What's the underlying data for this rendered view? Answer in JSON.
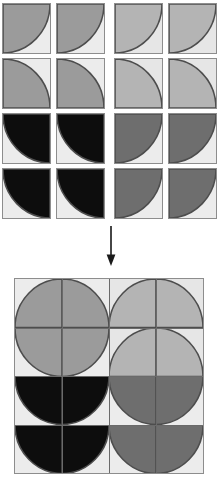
{
  "figure": {
    "arrow": {
      "name": "down-arrow",
      "direction": "down",
      "glyph": "↓"
    }
  },
  "palette": {
    "background": "#ffffff",
    "tile_background": "#ececec",
    "tile_background_light": "#e6e6e6",
    "outline": "#8d8d8d",
    "arc_outline": "#4d4d4d",
    "gridline": "#6a6a6a",
    "fill_mid_gray": "#9b9b9b",
    "fill_light_gray": "#b4b4b4",
    "fill_black": "#0d0d0d",
    "fill_dark_gray": "#6e6e6e",
    "arrow": "#1a1a1a"
  },
  "tileset": {
    "name": "separated-tiles",
    "rows": 4,
    "cols": 4,
    "tile_w": 49,
    "tile_h": 51,
    "gap_x": 5,
    "gap_y": 4,
    "col_extra_gap": [
      0,
      0,
      4,
      0
    ],
    "tiles": [
      {
        "id": "t-r1c1",
        "row": 0,
        "col": 0,
        "fill": "#9b9b9b",
        "bg": "#ececec",
        "corner": "tl",
        "label": "tile-row1-col1"
      },
      {
        "id": "t-r1c2",
        "row": 0,
        "col": 1,
        "fill": "#9b9b9b",
        "bg": "#ececec",
        "corner": "tl",
        "label": "tile-row1-col2"
      },
      {
        "id": "t-r1c3",
        "row": 0,
        "col": 2,
        "fill": "#b4b4b4",
        "bg": "#e6e6e6",
        "corner": "tl",
        "label": "tile-row1-col3"
      },
      {
        "id": "t-r1c4",
        "row": 0,
        "col": 3,
        "fill": "#b4b4b4",
        "bg": "#e6e6e6",
        "corner": "tl",
        "label": "tile-row1-col4"
      },
      {
        "id": "t-r2c1",
        "row": 1,
        "col": 0,
        "fill": "#9b9b9b",
        "bg": "#ececec",
        "corner": "bl",
        "label": "tile-row2-col1"
      },
      {
        "id": "t-r2c2",
        "row": 1,
        "col": 1,
        "fill": "#9b9b9b",
        "bg": "#ececec",
        "corner": "bl",
        "label": "tile-row2-col2"
      },
      {
        "id": "t-r2c3",
        "row": 1,
        "col": 2,
        "fill": "#b4b4b4",
        "bg": "#e6e6e6",
        "corner": "bl",
        "label": "tile-row2-col3"
      },
      {
        "id": "t-r2c4",
        "row": 1,
        "col": 3,
        "fill": "#b4b4b4",
        "bg": "#e6e6e6",
        "corner": "bl",
        "label": "tile-row2-col4"
      },
      {
        "id": "t-r3c1",
        "row": 2,
        "col": 0,
        "fill": "#0d0d0d",
        "bg": "#ececec",
        "corner": "tr",
        "label": "tile-row3-col1"
      },
      {
        "id": "t-r3c2",
        "row": 2,
        "col": 1,
        "fill": "#0d0d0d",
        "bg": "#ececec",
        "corner": "tr",
        "label": "tile-row3-col2"
      },
      {
        "id": "t-r3c3",
        "row": 2,
        "col": 2,
        "fill": "#6e6e6e",
        "bg": "#ececec",
        "corner": "tl",
        "label": "tile-row3-col3"
      },
      {
        "id": "t-r3c4",
        "row": 2,
        "col": 3,
        "fill": "#6e6e6e",
        "bg": "#ececec",
        "corner": "tl",
        "label": "tile-row3-col4"
      },
      {
        "id": "t-r4c1",
        "row": 3,
        "col": 0,
        "fill": "#0d0d0d",
        "bg": "#ececec",
        "corner": "tr",
        "label": "tile-row4-col1"
      },
      {
        "id": "t-r4c2",
        "row": 3,
        "col": 1,
        "fill": "#0d0d0d",
        "bg": "#ececec",
        "corner": "tr",
        "label": "tile-row4-col2"
      },
      {
        "id": "t-r4c3",
        "row": 3,
        "col": 2,
        "fill": "#6e6e6e",
        "bg": "#ececec",
        "corner": "tl",
        "label": "tile-row4-col3"
      },
      {
        "id": "t-r4c4",
        "row": 3,
        "col": 3,
        "fill": "#6e6e6e",
        "bg": "#ececec",
        "corner": "tl",
        "label": "tile-row4-col4"
      }
    ]
  },
  "assembly": {
    "name": "assembled-square",
    "rows": 4,
    "cols": 4,
    "cell_w": 47,
    "cell_h": 48.5,
    "cells": [
      {
        "id": "a-r1c1",
        "row": 0,
        "col": 0,
        "fill": "#9b9b9b",
        "bg": "#ececec",
        "corner": "br",
        "label": "cell-row1-col1"
      },
      {
        "id": "a-r1c2",
        "row": 0,
        "col": 1,
        "fill": "#9b9b9b",
        "bg": "#ececec",
        "corner": "bl",
        "label": "cell-row1-col2"
      },
      {
        "id": "a-r1c3",
        "row": 0,
        "col": 2,
        "fill": "#b4b4b4",
        "bg": "#e6e6e6",
        "corner": "br",
        "label": "cell-row1-col3"
      },
      {
        "id": "a-r1c4",
        "row": 0,
        "col": 3,
        "fill": "#b4b4b4",
        "bg": "#e6e6e6",
        "corner": "bl",
        "label": "cell-row1-col4"
      },
      {
        "id": "a-r2c1",
        "row": 1,
        "col": 0,
        "fill": "#9b9b9b",
        "bg": "#ececec",
        "corner": "tr",
        "label": "cell-row2-col1"
      },
      {
        "id": "a-r2c2",
        "row": 1,
        "col": 1,
        "fill": "#9b9b9b",
        "bg": "#ececec",
        "corner": "tl",
        "label": "cell-row2-col2"
      },
      {
        "id": "a-r2c3",
        "row": 1,
        "col": 2,
        "fill": "#b4b4b4",
        "bg": "#e6e6e6",
        "corner": "br",
        "label": "cell-row2-col3"
      },
      {
        "id": "a-r2c4",
        "row": 1,
        "col": 3,
        "fill": "#b4b4b4",
        "bg": "#e6e6e6",
        "corner": "bl",
        "label": "cell-row2-col4"
      },
      {
        "id": "a-r3c1",
        "row": 2,
        "col": 0,
        "fill": "#0d0d0d",
        "bg": "#ececec",
        "corner": "tr",
        "label": "cell-row3-col1"
      },
      {
        "id": "a-r3c2",
        "row": 2,
        "col": 1,
        "fill": "#0d0d0d",
        "bg": "#ececec",
        "corner": "tl",
        "label": "cell-row3-col2"
      },
      {
        "id": "a-r3c3",
        "row": 2,
        "col": 2,
        "fill": "#6e6e6e",
        "bg": "#ececec",
        "corner": "tr",
        "label": "cell-row3-col3"
      },
      {
        "id": "a-r3c4",
        "row": 2,
        "col": 3,
        "fill": "#6e6e6e",
        "bg": "#ececec",
        "corner": "tl",
        "label": "cell-row3-col4"
      },
      {
        "id": "a-r4c1",
        "row": 3,
        "col": 0,
        "fill": "#0d0d0d",
        "bg": "#ececec",
        "corner": "tr",
        "label": "cell-row4-col1"
      },
      {
        "id": "a-r4c2",
        "row": 3,
        "col": 1,
        "fill": "#0d0d0d",
        "bg": "#ececec",
        "corner": "tl",
        "label": "cell-row4-col2"
      },
      {
        "id": "a-r4c3",
        "row": 3,
        "col": 2,
        "fill": "#6e6e6e",
        "bg": "#ececec",
        "corner": "tr",
        "label": "cell-row4-col3"
      },
      {
        "id": "a-r4c4",
        "row": 3,
        "col": 3,
        "fill": "#6e6e6e",
        "bg": "#ececec",
        "corner": "tl",
        "label": "cell-row4-col4"
      }
    ]
  }
}
